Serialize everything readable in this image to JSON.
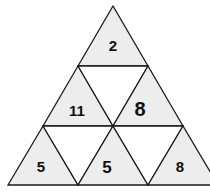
{
  "diagram": {
    "type": "triangle-number-puzzle",
    "rows": 3,
    "colors": {
      "upward_fill": "#ededed",
      "downward_fill": "#ffffff",
      "stroke": "#1a1a1a",
      "text": "#111111"
    },
    "cells": [
      {
        "row": 1,
        "position": 1,
        "orientation": "up",
        "value": "2"
      },
      {
        "row": 2,
        "position": 1,
        "orientation": "up",
        "value": "11"
      },
      {
        "row": 2,
        "position": 2,
        "orientation": "down",
        "value": ""
      },
      {
        "row": 2,
        "position": 3,
        "orientation": "up",
        "value": "8"
      },
      {
        "row": 3,
        "position": 1,
        "orientation": "up",
        "value": "5"
      },
      {
        "row": 3,
        "position": 2,
        "orientation": "down",
        "value": ""
      },
      {
        "row": 3,
        "position": 3,
        "orientation": "up",
        "value": "5"
      },
      {
        "row": 3,
        "position": 4,
        "orientation": "down",
        "value": ""
      },
      {
        "row": 3,
        "position": 5,
        "orientation": "up",
        "value": "8"
      }
    ]
  }
}
